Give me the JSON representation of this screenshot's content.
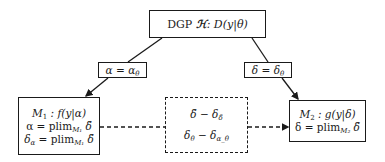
{
  "diagram": {
    "top_box": {
      "label_prefix": "DGP ",
      "script_symbol": "ℋ",
      "label_suffix": ": D(y|θ)"
    },
    "left_edge_label": {
      "lhs": "α",
      "eq": " = ",
      "rhs": "α",
      "rhs_sub": "θ"
    },
    "right_edge_label": {
      "lhs": "δ",
      "eq": " = ",
      "rhs": "δ",
      "rhs_sub": "θ"
    },
    "model_1": {
      "line1": {
        "name": "M",
        "sub": "1",
        "rest": " : f(y|α)"
      },
      "line2": {
        "lhs": "α = plim",
        "sub": "M₁",
        "rhs": " δ̃"
      },
      "line3": {
        "lhs": "δ",
        "lhs_sub": "α",
        "mid": " = plim",
        "sub": "M₁",
        "rhs": " δ̃"
      }
    },
    "center_box": {
      "line1": {
        "a": "δ̃ − δ",
        "sub": "δ̃"
      },
      "line2": {
        "a": "δ",
        "a_sub": "θ",
        "b": " − δ",
        "b_sub": "α_θ"
      }
    },
    "model_2": {
      "line1": {
        "name": "M",
        "sub": "2",
        "rest": " : g(y|δ)"
      },
      "line2": {
        "lhs": "δ = plim",
        "sub": "M₂",
        "rhs": " δ̃"
      }
    },
    "colors": {
      "stroke": "#1a1a1a",
      "background": "#ffffff"
    }
  }
}
